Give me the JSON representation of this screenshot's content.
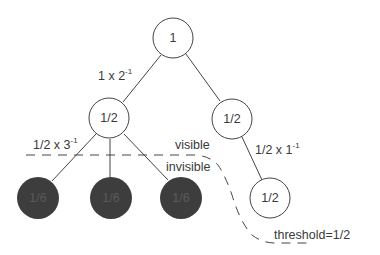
{
  "diagram": {
    "nodes": [
      {
        "id": "root",
        "label": "1",
        "filled": false
      },
      {
        "id": "left",
        "label": "1/2",
        "filled": false
      },
      {
        "id": "right",
        "label": "1/2",
        "filled": false
      },
      {
        "id": "right-child",
        "label": "1/2",
        "filled": false
      },
      {
        "id": "left-child-1",
        "label": "1/6",
        "filled": true
      },
      {
        "id": "left-child-2",
        "label": "1/6",
        "filled": true
      },
      {
        "id": "left-child-3",
        "label": "1/6",
        "filled": true
      }
    ],
    "edge_labels": {
      "root_left": {
        "base": "1 x 2",
        "exp": "-1"
      },
      "left_children": {
        "base": "1/2 x 3",
        "exp": "-1"
      },
      "right_child": {
        "base": "1/2 x 1",
        "exp": "-1"
      }
    },
    "region_labels": {
      "visible": "visible",
      "invisible": "invisible",
      "threshold": "threshold=1/2"
    },
    "colors": {
      "stroke": "#444444",
      "filled_node": "#3d3d3d",
      "background": "#ffffff"
    }
  }
}
